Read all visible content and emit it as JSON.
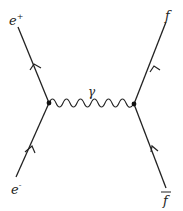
{
  "diagram": {
    "type": "feynman",
    "process": "e+ e- annihilation to f fbar via photon",
    "labels": {
      "e_plus": "e",
      "e_plus_sup": "+",
      "e_minus": "e",
      "e_minus_sup": "-",
      "f_out": "f",
      "f_bar": "f",
      "photon": "γ"
    },
    "colors": {
      "line": "#222222",
      "background": "#ffffff"
    }
  }
}
